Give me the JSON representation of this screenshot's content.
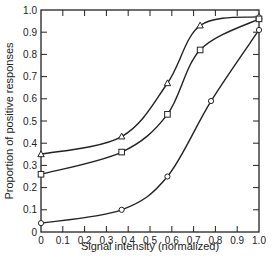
{
  "chart_data": {
    "type": "line",
    "title": "",
    "xlabel": "Signal intensity (normalized)",
    "ylabel": "Proportion of positive responses",
    "xlim": [
      0,
      1.0
    ],
    "ylim": [
      0,
      1.0
    ],
    "grid": false,
    "legend": "none",
    "x_ticks": [
      "0",
      "0.1",
      "0.2",
      "0.3",
      "0.4",
      "0.5",
      "0.6",
      "0.7",
      "0.8",
      "0.9",
      "1.0"
    ],
    "y_ticks": [
      "0",
      "0.1",
      "0.2",
      "0.3",
      "0.4",
      "0.5",
      "0.6",
      "0.7",
      "0.8",
      "0.9",
      "1.0"
    ],
    "series": [
      {
        "name": "triangle",
        "marker": "triangle",
        "x": [
          0,
          0.37,
          0.58,
          0.73,
          1.0
        ],
        "y": [
          0.35,
          0.43,
          0.67,
          0.93,
          0.97
        ]
      },
      {
        "name": "square",
        "marker": "square",
        "x": [
          0,
          0.37,
          0.58,
          0.73,
          1.0
        ],
        "y": [
          0.26,
          0.36,
          0.53,
          0.82,
          0.96
        ]
      },
      {
        "name": "circle",
        "marker": "circle",
        "x": [
          0,
          0.37,
          0.58,
          0.78,
          1.0
        ],
        "y": [
          0.04,
          0.1,
          0.25,
          0.59,
          0.91
        ]
      }
    ]
  },
  "colors": {
    "ink": "#222222",
    "background": "#ffffff"
  }
}
